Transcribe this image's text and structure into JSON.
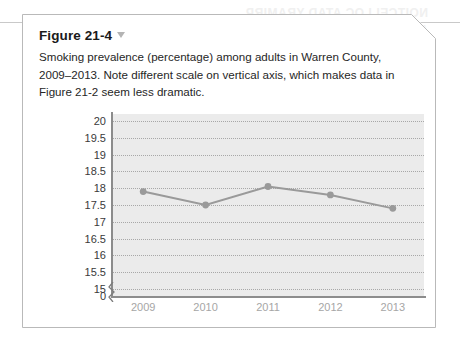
{
  "figure": {
    "title": "Figure 21-4",
    "title_marker_icon": "triangle-down-icon",
    "caption": "Smoking prevalence (percentage) among adults in Warren County, 2009–2013. Note different scale on vertical axis, which makes data in Figure 21-2 seem less dramatic."
  },
  "background_ghost": {
    "line1": "NOITCELLOC ATAD YRAMIRP",
    "line2": "ATAD GNIZYLANA"
  },
  "colors": {
    "plot_background": "#ebebeb",
    "gridline": "#a8a8a8",
    "axis": "#8c8c8c",
    "series_line": "#9a9a9a",
    "series_marker": "#9a9a9a",
    "x_tick_text": "#a6a6a6",
    "y_tick_text": "#3a3a3a",
    "card_border": "#b9b9b9",
    "title_marker": "#b4b4b4"
  },
  "chart_data": {
    "type": "line",
    "title": "",
    "xlabel": "",
    "ylabel": "",
    "categories": [
      "2009",
      "2010",
      "2011",
      "2012",
      "2013"
    ],
    "values": [
      17.9,
      17.5,
      18.05,
      17.8,
      17.4
    ],
    "series": [
      {
        "name": "Smoking prevalence (percentage)",
        "values": [
          17.9,
          17.5,
          18.05,
          17.8,
          17.4
        ]
      }
    ],
    "ylim": [
      15,
      20
    ],
    "y_ticks": [
      "20",
      "19.5",
      "19",
      "18.5",
      "18",
      "17.5",
      "17",
      "16.5",
      "16",
      "15.5",
      "15"
    ],
    "y_tick_values": [
      20,
      19.5,
      19,
      18.5,
      18,
      17.5,
      17,
      16.5,
      16,
      15.5,
      15
    ],
    "y_axis_origin_label": "0",
    "y_axis_break": true,
    "grid": true,
    "legend": "none"
  }
}
